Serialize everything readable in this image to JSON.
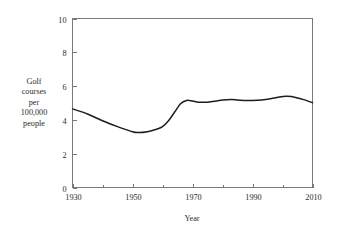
{
  "chart_data": {
    "type": "line",
    "title": "",
    "subtitle": "",
    "xlabel": "Year",
    "ylabel": "Golf courses per 100,000 people",
    "ylabel_lines": [
      "Golf",
      "courses",
      "per",
      "100,000",
      "people"
    ],
    "xlim": [
      1930,
      2010
    ],
    "ylim": [
      0,
      10
    ],
    "xticks": [
      1930,
      1950,
      1970,
      1990,
      2010
    ],
    "xtick_labels": [
      "1930",
      "1950",
      "1970",
      "1990",
      "2010"
    ],
    "xminor_ticks": [
      1940,
      1960,
      1980,
      2000
    ],
    "yticks": [
      0,
      2,
      4,
      6,
      8,
      10
    ],
    "ytick_labels": [
      "0",
      "2",
      "4",
      "6",
      "8",
      "10"
    ],
    "grid": false,
    "legend": false,
    "legend_position": "none",
    "line_color": "#1d1d1d",
    "axis_color": "#6b6b6b",
    "background_color": "#ffffff",
    "series": [
      {
        "name": "Golf courses per 100,000 people",
        "x": [
          1930,
          1935,
          1940,
          1945,
          1950,
          1952,
          1955,
          1958,
          1960,
          1962,
          1964,
          1966,
          1968,
          1970,
          1972,
          1975,
          1978,
          1980,
          1983,
          1985,
          1988,
          1990,
          1993,
          1996,
          1999,
          2001,
          2003,
          2005,
          2007,
          2010
        ],
        "values": [
          4.65,
          4.35,
          3.95,
          3.6,
          3.3,
          3.25,
          3.3,
          3.45,
          3.6,
          3.95,
          4.45,
          4.95,
          5.15,
          5.12,
          5.05,
          5.05,
          5.12,
          5.18,
          5.2,
          5.18,
          5.15,
          5.15,
          5.18,
          5.25,
          5.35,
          5.4,
          5.38,
          5.3,
          5.2,
          5.02
        ]
      }
    ]
  },
  "axis_titles": {
    "x": "Year"
  }
}
